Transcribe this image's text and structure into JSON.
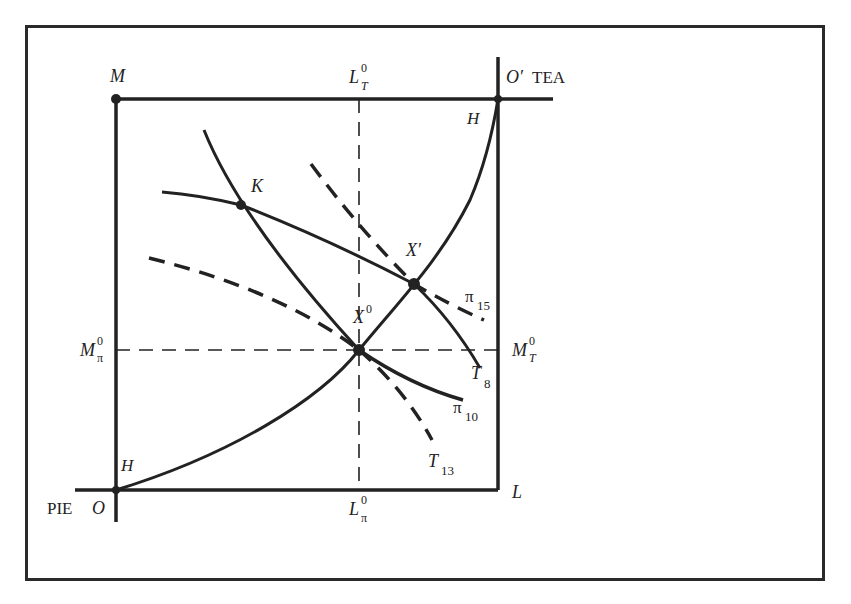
{
  "figure": {
    "origin_label": "O",
    "origin_good": "PIE",
    "origin2_label": "O′",
    "origin2_good": "TEA",
    "corner_top_left": "M",
    "corner_bottom_right": "L",
    "contract_curve_label_low": "H",
    "contract_curve_label_high": "H",
    "point_K": "K",
    "point_X0": "X",
    "point_X0_sup": "0",
    "point_Xprime": "X′",
    "L_T0": {
      "base": "L",
      "sup": "0",
      "sub": "T"
    },
    "L_pi0": {
      "base": "L",
      "sup": "0",
      "sub": "π"
    },
    "M_pi0": {
      "base": "M",
      "sup": "0",
      "sub": "π"
    },
    "M_T0": {
      "base": "M",
      "sup": "0",
      "sub": "T"
    },
    "curves": {
      "T8": {
        "base": "T",
        "sub": "8",
        "style": "solid"
      },
      "T13": {
        "base": "T",
        "sub": "13",
        "style": "dashed"
      },
      "pi10": {
        "base": "π",
        "sub": "10",
        "style": "solid"
      },
      "pi15": {
        "base": "π",
        "sub": "15",
        "style": "dashed"
      }
    }
  },
  "colors": {
    "ink": "#222222",
    "background": "#ffffff"
  }
}
